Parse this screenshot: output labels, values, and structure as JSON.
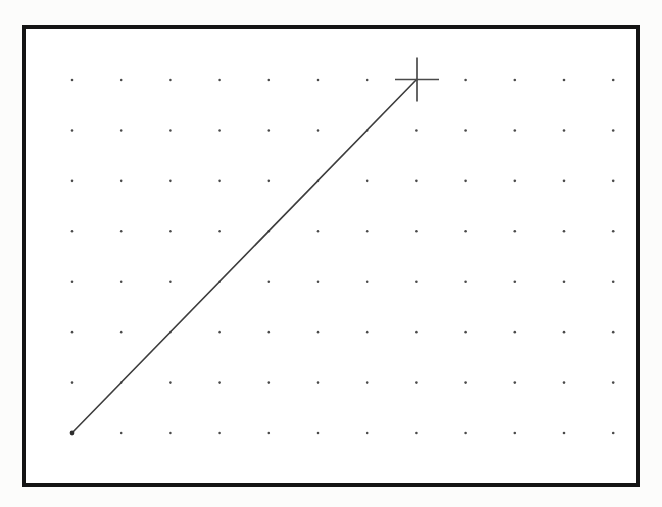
{
  "page": {
    "width": 662,
    "height": 507,
    "background_color": "#fcfcfb"
  },
  "canvas": {
    "frame": {
      "x": 22,
      "y": 25,
      "width": 618,
      "height": 462,
      "border_width": 4,
      "border_color": "#141414",
      "fill_color": "#ffffff"
    },
    "grid": {
      "origin_x": 72,
      "origin_y": 80,
      "spacing_x": 49.2,
      "spacing_y": 50.43,
      "columns": 12,
      "rows": 8,
      "dot_radius": 1.3,
      "dot_color": "#4a4a4a"
    },
    "drawn_line": {
      "x1": 72,
      "y1": 433,
      "x2": 416,
      "y2": 80,
      "stroke_color": "#3d3d3d",
      "stroke_width": 1.6,
      "start_anchor_radius": 2.4,
      "start_anchor_color": "#2e2e2e"
    },
    "crosshair_cursor": {
      "center_x": 417,
      "center_y": 79.5,
      "arm_half_length": 22,
      "stroke_color": "#4a4a4a",
      "stroke_width": 1.7
    }
  }
}
